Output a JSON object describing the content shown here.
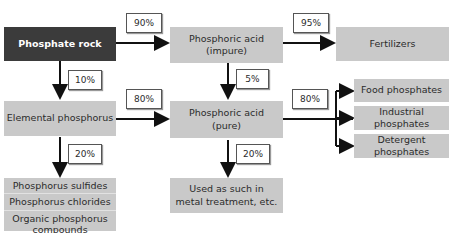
{
  "nodes": {
    "phosphate_rock": "Phosphate rock",
    "acid_impure_l1": "Phosphoric acid",
    "acid_impure_l2": "(impure)",
    "fertilizers": "Fertilizers",
    "elemental_phosphorus": "Elemental phosphorus",
    "acid_pure_l1": "Phosphoric acid",
    "acid_pure_l2": "(pure)",
    "food_phosphates": "Food phosphates",
    "industrial_phosphates": "Industrial phosphates",
    "detergent_phosphates": "Detergent phosphates",
    "products": [
      "Phosphorus sulfides",
      "Phosphorus chlorides",
      "Organic phosphorus compounds"
    ],
    "metal_l1": "Used as such in",
    "metal_l2": "metal treatment, etc."
  },
  "flows": {
    "rock_to_impure": "90%",
    "impure_to_fertilizers": "95%",
    "rock_to_elemental": "10%",
    "impure_to_pure": "5%",
    "elemental_to_pure": "80%",
    "pure_to_phosphates": "80%",
    "elemental_to_products": "20%",
    "pure_to_metal": "20%"
  }
}
